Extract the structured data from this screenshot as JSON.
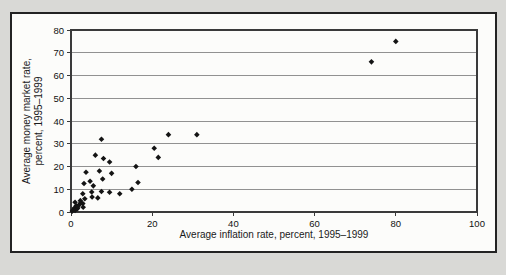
{
  "figure": {
    "background_color": "#d9d9d6",
    "panel_background": "#fcfcfa",
    "panel_border_color": "#232323",
    "grid_color": "#919191",
    "frame_color": "#3a3a3a",
    "text_color": "#111111"
  },
  "chart_data": {
    "type": "scatter",
    "title": "",
    "xlabel": "Average inflation rate, percent, 1995–1999",
    "ylabel_lines": [
      "Average money market rate,",
      "percent, 1995–1999"
    ],
    "xlim": [
      0,
      100
    ],
    "ylim": [
      0,
      80
    ],
    "xticks": [
      0,
      20,
      40,
      60,
      80,
      100
    ],
    "yticks": [
      0,
      10,
      20,
      30,
      40,
      50,
      60,
      70,
      80
    ],
    "grid": "horizontal",
    "legend": "none",
    "marker": {
      "shape": "diamond",
      "color": "#141414",
      "size": 5.6
    },
    "points": [
      [
        0.3,
        0.4
      ],
      [
        0.6,
        1.1
      ],
      [
        1,
        0.7
      ],
      [
        0.9,
        1.9
      ],
      [
        1.3,
        2.7
      ],
      [
        1.6,
        1.5
      ],
      [
        2,
        3.2
      ],
      [
        2.4,
        4
      ],
      [
        1.7,
        2.3
      ],
      [
        1,
        4.3
      ],
      [
        2.3,
        5
      ],
      [
        3,
        2.1
      ],
      [
        2.9,
        3.7
      ],
      [
        3.4,
        5.8
      ],
      [
        5.2,
        6.6
      ],
      [
        6.6,
        6.2
      ],
      [
        2.9,
        8
      ],
      [
        5.1,
        8.8
      ],
      [
        7.5,
        9
      ],
      [
        9.5,
        8.7
      ],
      [
        12,
        8
      ],
      [
        15,
        10
      ],
      [
        3.2,
        12.5
      ],
      [
        4.7,
        13.5
      ],
      [
        5.5,
        11.5
      ],
      [
        3.7,
        17.5
      ],
      [
        7,
        18
      ],
      [
        10,
        17
      ],
      [
        7.8,
        14.5
      ],
      [
        16.5,
        13
      ],
      [
        6,
        25
      ],
      [
        8,
        23.5
      ],
      [
        9.5,
        22
      ],
      [
        16,
        20
      ],
      [
        20.5,
        28
      ],
      [
        21.5,
        24
      ],
      [
        7.5,
        32
      ],
      [
        24,
        34
      ],
      [
        31,
        34
      ],
      [
        74,
        66
      ],
      [
        80,
        75
      ]
    ]
  }
}
